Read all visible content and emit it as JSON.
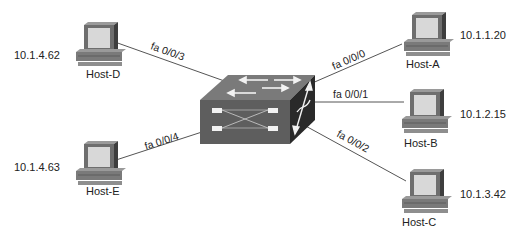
{
  "diagram": {
    "type": "network-topology",
    "colors": {
      "link": "#555555",
      "switch_top": "#7a7a7a",
      "switch_front": "#5e5e5e",
      "switch_side": "#2a2a2a",
      "monitor_body": "#6e6e6e",
      "screen": "#d8d8d8",
      "text": "#222222"
    },
    "switch": {
      "name": "switch"
    },
    "hosts": [
      {
        "id": "host-d",
        "name": "Host-D",
        "ip": "10.1.4.62",
        "port": "fa 0/0/3"
      },
      {
        "id": "host-e",
        "name": "Host-E",
        "ip": "10.1.4.63",
        "port": "fa 0/0/4"
      },
      {
        "id": "host-a",
        "name": "Host-A",
        "ip": "10.1.1.20",
        "port": "fa 0/0/0"
      },
      {
        "id": "host-b",
        "name": "Host-B",
        "ip": "10.1.2.15",
        "port": "fa 0/0/1"
      },
      {
        "id": "host-c",
        "name": "Host-C",
        "ip": "10.1.3.42",
        "port": "fa 0/0/2"
      }
    ]
  }
}
